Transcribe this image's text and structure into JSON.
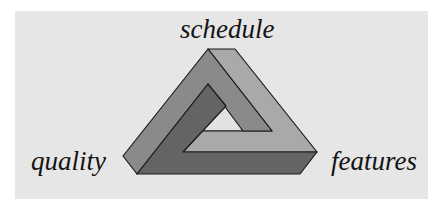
{
  "diagram": {
    "type": "impossible-triangle (Penrose triangle)",
    "labels": {
      "top": "schedule",
      "left": "quality",
      "right": "features"
    },
    "colors": {
      "background": "#ffffff",
      "panel": "#e6e6e6",
      "face_medium": "#8a8a8a",
      "face_light": "#a9a9a9",
      "face_dark": "#646464",
      "hole": "#e2e2e2",
      "stroke": "#1a1a1a",
      "text": "#141414"
    }
  }
}
